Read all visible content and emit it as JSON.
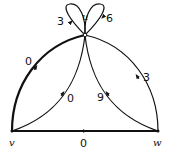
{
  "graph": {
    "vertices": [
      {
        "id": "u",
        "label": "u"
      },
      {
        "id": "v",
        "label": "v"
      },
      {
        "id": "w",
        "label": "w"
      }
    ],
    "edges": [
      {
        "id": "loop-u-left",
        "from": "u",
        "to": "u",
        "weight": "3",
        "bold": false
      },
      {
        "id": "loop-u-right",
        "from": "u",
        "to": "u",
        "weight": "6",
        "bold": false
      },
      {
        "id": "v-u-outer",
        "from": "v",
        "to": "u",
        "weight": "0",
        "bold": true
      },
      {
        "id": "v-u-inner",
        "from": "v",
        "to": "u",
        "weight": "0",
        "bold": false
      },
      {
        "id": "w-u-inner",
        "from": "w",
        "to": "u",
        "weight": "9",
        "bold": false
      },
      {
        "id": "w-u-outer",
        "from": "w",
        "to": "u",
        "weight": "3",
        "bold": false
      },
      {
        "id": "v-w",
        "from": "v",
        "to": "w",
        "weight": "0",
        "bold": true
      }
    ]
  }
}
